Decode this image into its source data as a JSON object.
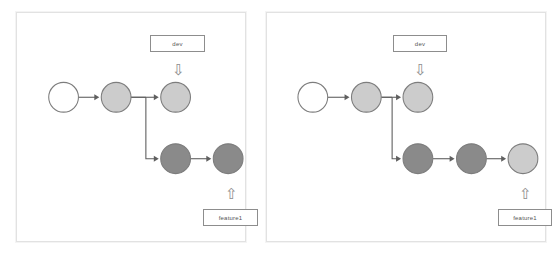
{
  "diagram": {
    "colors": {
      "node_empty_fill": "#ffffff",
      "node_light_fill": "#cccccc",
      "node_dark_fill": "#8a8a8a",
      "node_stroke": "#7d7d7d",
      "edge": "#5f5f5f",
      "label_border": "#8d8d8d",
      "label_text": "#555555",
      "panel_border": "#e2e2e2",
      "background": "#ffffff"
    },
    "node_radius": 15,
    "panels": [
      {
        "id": "panel-left",
        "name": "before-commit-diagram",
        "nodes": [
          {
            "id": "l-c0",
            "name": "commit-node-root",
            "cx": 47,
            "cy": 85,
            "tone": "empty"
          },
          {
            "id": "l-c1",
            "name": "commit-node-base",
            "cx": 100,
            "cy": 85,
            "tone": "light"
          },
          {
            "id": "l-c2",
            "name": "commit-node-dev-tip",
            "cx": 160,
            "cy": 85,
            "tone": "light"
          },
          {
            "id": "l-f1",
            "name": "commit-node-feature",
            "cx": 160,
            "cy": 147,
            "tone": "dark"
          },
          {
            "id": "l-f2",
            "name": "commit-node-feature-tip",
            "cx": 213,
            "cy": 147,
            "tone": "dark"
          }
        ],
        "edges": [
          {
            "name": "edge-root-to-base",
            "from": "l-c0",
            "to": "l-c1",
            "kind": "straight"
          },
          {
            "name": "edge-base-to-dev-tip",
            "from": "l-c1",
            "to": "l-c2",
            "kind": "straight"
          },
          {
            "name": "edge-base-to-feature",
            "from": "l-c1",
            "to": "l-f1",
            "kind": "elbow",
            "split_x": 130
          },
          {
            "name": "edge-feature-to-tip",
            "from": "l-f1",
            "to": "l-f2",
            "kind": "straight"
          }
        ],
        "labels": [
          {
            "name": "branch-label-dev",
            "text": "dev",
            "x": 133,
            "y": 22,
            "w": 55,
            "h": 17
          },
          {
            "name": "branch-label-feature1",
            "text": "feature1",
            "x": 186,
            "y": 196,
            "w": 55,
            "h": 17
          }
        ],
        "markers": [
          {
            "name": "dev-pointer-arrow-icon",
            "glyph": "⇩",
            "x": 153,
            "y": 46,
            "w": 16,
            "h": 20
          },
          {
            "name": "feature1-pointer-arrow-icon",
            "glyph": "⇧",
            "x": 206,
            "y": 170,
            "w": 16,
            "h": 20
          }
        ]
      },
      {
        "id": "panel-right",
        "name": "after-commit-diagram",
        "nodes": [
          {
            "id": "r-c0",
            "name": "commit-node-root",
            "cx": 46,
            "cy": 85,
            "tone": "empty"
          },
          {
            "id": "r-c1",
            "name": "commit-node-base",
            "cx": 100,
            "cy": 85,
            "tone": "light"
          },
          {
            "id": "r-c2",
            "name": "commit-node-dev-tip",
            "cx": 152,
            "cy": 85,
            "tone": "light"
          },
          {
            "id": "r-f1",
            "name": "commit-node-feature",
            "cx": 152,
            "cy": 147,
            "tone": "dark"
          },
          {
            "id": "r-f2",
            "name": "commit-node-feature-mid",
            "cx": 206,
            "cy": 147,
            "tone": "dark"
          },
          {
            "id": "r-f3",
            "name": "commit-node-feature-tip",
            "cx": 258,
            "cy": 147,
            "tone": "light"
          }
        ],
        "edges": [
          {
            "name": "edge-root-to-base",
            "from": "r-c0",
            "to": "r-c1",
            "kind": "straight"
          },
          {
            "name": "edge-base-to-dev-tip",
            "from": "r-c1",
            "to": "r-c2",
            "kind": "straight"
          },
          {
            "name": "edge-base-to-feature",
            "from": "r-c1",
            "to": "r-f1",
            "kind": "elbow",
            "split_x": 126
          },
          {
            "name": "edge-feature-to-mid",
            "from": "r-f1",
            "to": "r-f2",
            "kind": "straight"
          },
          {
            "name": "edge-mid-to-tip",
            "from": "r-f2",
            "to": "r-f3",
            "kind": "straight"
          }
        ],
        "labels": [
          {
            "name": "branch-label-dev",
            "text": "dev",
            "x": 126,
            "y": 22,
            "w": 54,
            "h": 17
          },
          {
            "name": "branch-label-feature1",
            "text": "feature1",
            "x": 231,
            "y": 196,
            "w": 54,
            "h": 17
          }
        ],
        "markers": [
          {
            "name": "dev-pointer-arrow-icon",
            "glyph": "⇩",
            "x": 145,
            "y": 46,
            "w": 16,
            "h": 20
          },
          {
            "name": "feature1-pointer-arrow-icon",
            "glyph": "⇧",
            "x": 250,
            "y": 170,
            "w": 16,
            "h": 20
          }
        ]
      }
    ]
  }
}
